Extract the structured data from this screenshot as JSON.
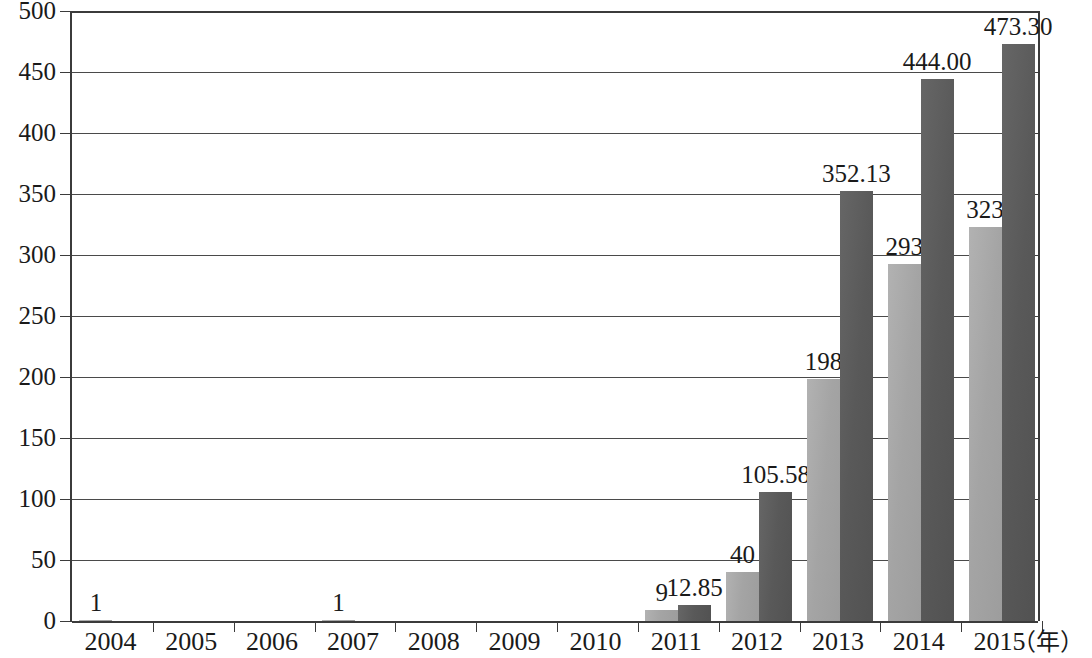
{
  "chart_data": {
    "type": "bar",
    "title": "",
    "subtitle": "",
    "xlabel": "（年）",
    "ylabel": "",
    "categories": [
      "2004",
      "2005",
      "2006",
      "2007",
      "2008",
      "2009",
      "2010",
      "2011",
      "2012",
      "2013",
      "2014",
      "2015"
    ],
    "ylim": [
      0,
      500
    ],
    "yticks": [
      0,
      50,
      100,
      150,
      200,
      250,
      300,
      350,
      400,
      450,
      500
    ],
    "ytick_labels": [
      "0",
      "50",
      "100",
      "150",
      "200",
      "250",
      "300",
      "350",
      "400",
      "450",
      "500"
    ],
    "grid": true,
    "legend": "none",
    "series": [
      {
        "name": "series-a",
        "color": "#a9a9a9",
        "values": [
          1,
          null,
          null,
          1,
          null,
          null,
          null,
          9,
          40,
          198,
          293,
          323
        ],
        "labels": [
          "1",
          "",
          "",
          "1",
          "",
          "",
          "",
          "9",
          "40",
          "198",
          "293",
          "323"
        ]
      },
      {
        "name": "series-b",
        "color": "#5c5c5c",
        "values": [
          null,
          null,
          null,
          null,
          null,
          null,
          null,
          12.85,
          105.58,
          352.13,
          444.0,
          473.3
        ],
        "labels": [
          "",
          "",
          "",
          "",
          "",
          "",
          "",
          "12.85",
          "105.58",
          "352.13",
          "444.00",
          "473.30"
        ]
      }
    ]
  },
  "axis": {
    "unit_label": "（年）"
  },
  "colors": {
    "series_a": "#a9a9a9",
    "series_b": "#5c5c5c",
    "axis": "#3b3b3b",
    "grid": "#4a4a4a",
    "background": "#ffffff",
    "text": "#1a1a1a"
  }
}
